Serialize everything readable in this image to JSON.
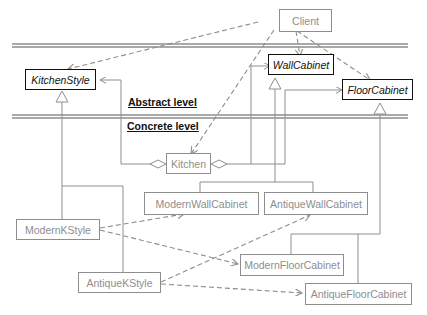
{
  "diagram": {
    "type": "UML class diagram (Abstract Factory pattern)",
    "levels": {
      "abstract_label": "Abstract level",
      "concrete_label": "Concrete level"
    },
    "classes": {
      "client": "Client",
      "kitchen_style": "KitchenStyle",
      "wall_cabinet": "WallCabinet",
      "floor_cabinet": "FloorCabinet",
      "kitchen": "Kitchen",
      "modern_wall_cabinet": "ModernWallCabinet",
      "antique_wall_cabinet": "AntiqueWallCabinet",
      "modern_kstyle": "ModernKStyle",
      "antique_kstyle": "AntiqueKStyle",
      "modern_floor_cabinet": "ModernFloorCabinet",
      "antique_floor_cabinet": "AntiqueFloorCabinet"
    },
    "abstract_classes": [
      "KitchenStyle",
      "WallCabinet",
      "FloorCabinet"
    ],
    "relationships": [
      {
        "from": "Client",
        "to": "KitchenStyle",
        "kind": "dependency"
      },
      {
        "from": "Client",
        "to": "WallCabinet",
        "kind": "dependency"
      },
      {
        "from": "Client",
        "to": "FloorCabinet",
        "kind": "dependency"
      },
      {
        "from": "Client",
        "to": "Kitchen",
        "kind": "dependency"
      },
      {
        "from": "Kitchen",
        "to": "KitchenStyle",
        "kind": "aggregation"
      },
      {
        "from": "Kitchen",
        "to": "WallCabinet",
        "kind": "aggregation"
      },
      {
        "from": "Kitchen",
        "to": "FloorCabinet",
        "kind": "aggregation"
      },
      {
        "from": "ModernKStyle",
        "to": "KitchenStyle",
        "kind": "generalization"
      },
      {
        "from": "AntiqueKStyle",
        "to": "KitchenStyle",
        "kind": "generalization"
      },
      {
        "from": "ModernWallCabinet",
        "to": "WallCabinet",
        "kind": "generalization"
      },
      {
        "from": "AntiqueWallCabinet",
        "to": "WallCabinet",
        "kind": "generalization"
      },
      {
        "from": "ModernFloorCabinet",
        "to": "FloorCabinet",
        "kind": "generalization"
      },
      {
        "from": "AntiqueFloorCabinet",
        "to": "FloorCabinet",
        "kind": "generalization"
      },
      {
        "from": "ModernKStyle",
        "to": "ModernWallCabinet",
        "kind": "dependency"
      },
      {
        "from": "ModernKStyle",
        "to": "ModernFloorCabinet",
        "kind": "dependency"
      },
      {
        "from": "AntiqueKStyle",
        "to": "AntiqueWallCabinet",
        "kind": "dependency"
      },
      {
        "from": "AntiqueKStyle",
        "to": "AntiqueFloorCabinet",
        "kind": "dependency"
      }
    ]
  },
  "colors": {
    "abstract": "#111111",
    "concrete": "#8e8e8e",
    "divider": "#555555"
  }
}
